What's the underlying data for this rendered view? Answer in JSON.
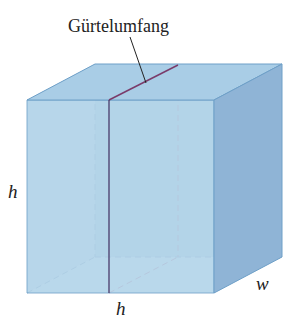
{
  "diagram": {
    "type": "box-girth",
    "labels": {
      "girth": "Gürtelumfang",
      "height_left": "h",
      "height_bottom": "h",
      "width": "w"
    },
    "colors": {
      "front_face": "#b7d6ea",
      "top_face": "#a9cde6",
      "side_face": "#8fb4d6",
      "back_face": "#a6cbe3",
      "bottom_face": "#c6e2f1",
      "edge": "#6fa0c8",
      "girth_line": "#7a3b6a",
      "hidden_girth": "#b08aa8",
      "hidden_edge": "#7fa8c8"
    }
  }
}
